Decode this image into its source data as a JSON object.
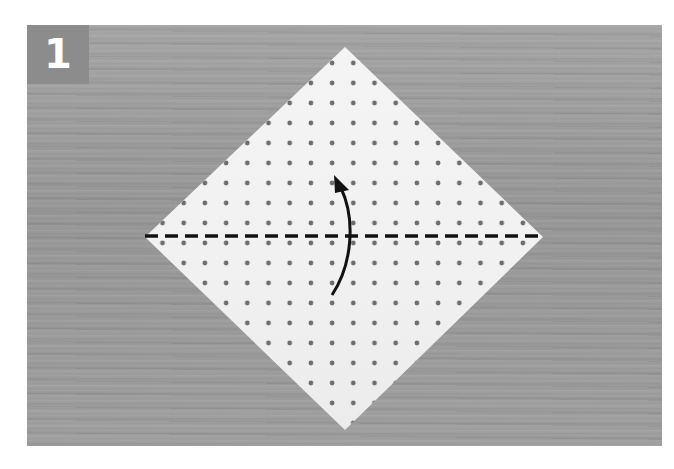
{
  "step": {
    "number": "1"
  },
  "colors": {
    "background": "#ffffff",
    "wood": "#9a9a9a",
    "badge": "#8c8c8c",
    "paper": "#f2f2f2",
    "dots": "#6e6e6e",
    "fold_line": "#111111",
    "arrow": "#111111"
  },
  "diagram": {
    "paper_shape": "diamond",
    "fold_line": "dashed-horizontal-valley-fold",
    "arrow": "curved-arrow-up",
    "instruction": "fold bottom half up along diagonal"
  }
}
